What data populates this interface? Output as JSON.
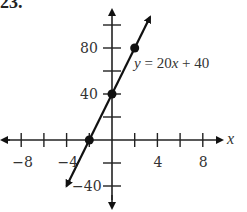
{
  "problem_label": "23.",
  "chart_data": {
    "type": "line",
    "title": "",
    "equation": "y = 20x + 40",
    "xlabel": "x",
    "ylabel": "y",
    "xlim": [
      -10,
      10
    ],
    "ylim": [
      -60,
      120
    ],
    "x_ticks": [
      -8,
      -4,
      4,
      8
    ],
    "y_ticks": [
      80,
      40,
      -40
    ],
    "x_tick_step": 2,
    "y_tick_step": 20,
    "series": [
      {
        "name": "y = 20x + 40",
        "x": [
          -2,
          0,
          2
        ],
        "y": [
          0,
          40,
          80
        ]
      }
    ],
    "points": [
      {
        "x": -2,
        "y": 0
      },
      {
        "x": 0,
        "y": 40
      },
      {
        "x": 2,
        "y": 80
      }
    ],
    "grid": false,
    "legend": "none"
  }
}
